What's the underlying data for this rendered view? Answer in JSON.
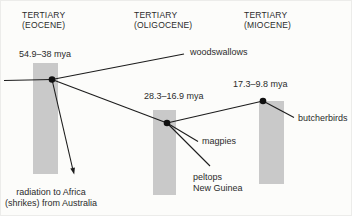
{
  "columns": [
    {
      "line1": "TERTIARY",
      "line2": "(EOCENE)"
    },
    {
      "line1": "TERTIARY",
      "line2": "(OLIGOCENE)"
    },
    {
      "line1": "TERTIARY",
      "line2": "(MIOCENE)"
    }
  ],
  "ages": {
    "eocene_node": "54.9–38 mya",
    "oligocene_node": "28.3–16.9 mya",
    "miocene_node": "17.3–9.8 mya"
  },
  "taxa": {
    "woodswallows": "woodswallows",
    "magpies": "magpies",
    "peltops": "peltops",
    "peltops_region": "New Guinea",
    "butcherbirds": "butcherbirds"
  },
  "annotation": {
    "line1": "radiation to Africa",
    "line2": "(shrikes) from Australia"
  },
  "diagram": {
    "type": "phylogenetic-timeline",
    "divergence_events": [
      {
        "age": "54.9–38 mya",
        "period": "TERTIARY (EOCENE)",
        "branches": [
          "woodswallows",
          "radiation to Africa (shrikes) from Australia",
          "later node 28.3–16.9 mya"
        ]
      },
      {
        "age": "28.3–16.9 mya",
        "period": "TERTIARY (OLIGOCENE)",
        "branches": [
          "magpies",
          "peltops New Guinea",
          "later node 17.3–9.8 mya"
        ]
      },
      {
        "age": "17.3–9.8 mya",
        "period": "TERTIARY (MIOCENE)",
        "branches": [
          "butcherbirds"
        ]
      }
    ]
  },
  "colors": {
    "bar_fill": "#c9c9c9",
    "line": "#1c1c1c",
    "text": "#2b2b2b",
    "background": "#fcfcfa"
  }
}
